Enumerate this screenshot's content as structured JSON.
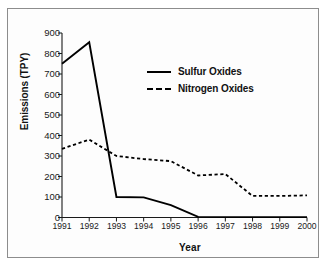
{
  "chart_data": {
    "type": "line",
    "title": "",
    "xlabel": "Year",
    "ylabel": "Emissions (TPY)",
    "categories": [
      "1991",
      "1992",
      "1993",
      "1994",
      "1995",
      "1996",
      "1997",
      "1998",
      "1999",
      "2000"
    ],
    "x": [
      1991,
      1992,
      1993,
      1994,
      1995,
      1996,
      1997,
      1998,
      1999,
      2000
    ],
    "xlim": [
      1991,
      2000
    ],
    "ylim": [
      0,
      900
    ],
    "yticks": [
      0,
      100,
      200,
      300,
      400,
      500,
      600,
      700,
      800,
      900
    ],
    "ytick_labels": [
      "0",
      "100",
      "200",
      "300",
      "400",
      "500",
      "600",
      "700",
      "800",
      "900"
    ],
    "grid": false,
    "legend_position": "upper-center",
    "series": [
      {
        "name": "Sulfur Oxides",
        "style": "solid",
        "color": "#000000",
        "values": [
          750,
          855,
          100,
          98,
          60,
          3,
          2,
          2,
          2,
          2
        ]
      },
      {
        "name": "Nitrogen Oxides",
        "style": "dashed",
        "color": "#000000",
        "values": [
          335,
          380,
          300,
          285,
          275,
          205,
          212,
          105,
          105,
          108
        ]
      }
    ]
  },
  "legend": {
    "items": [
      {
        "label": "Sulfur Oxides",
        "style": "solid"
      },
      {
        "label": "Nitrogen Oxides",
        "style": "dashed"
      }
    ]
  },
  "axes": {
    "x_title": "Year",
    "y_title": "Emissions (TPY)"
  }
}
